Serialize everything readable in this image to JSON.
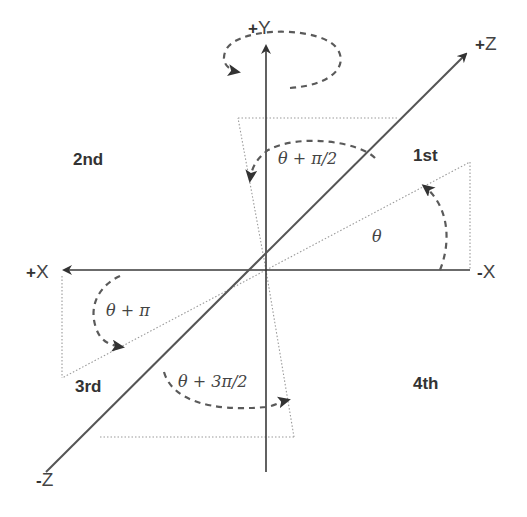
{
  "diagram": {
    "axes": {
      "pos_y": {
        "sign": "+",
        "letter": "Y"
      },
      "pos_z": {
        "sign": "+",
        "letter": "Z"
      },
      "neg_z": {
        "sign": "-",
        "letter": "Z"
      },
      "pos_x": {
        "sign": "+",
        "letter": "X"
      },
      "neg_x": {
        "sign": "-",
        "letter": "X"
      }
    },
    "quadrants": {
      "first": "1st",
      "second": "2nd",
      "third": "3rd",
      "fourth": "4th"
    },
    "angles": {
      "q1": "θ",
      "q2": "θ + π/2",
      "q3": "θ + π",
      "q4": "θ + 3π/2"
    },
    "colors": {
      "axis": "#3a3a3a",
      "dotted": "#9a9a9a",
      "arc": "#5a5a5a",
      "text": "#333333",
      "background": "#ffffff"
    }
  }
}
